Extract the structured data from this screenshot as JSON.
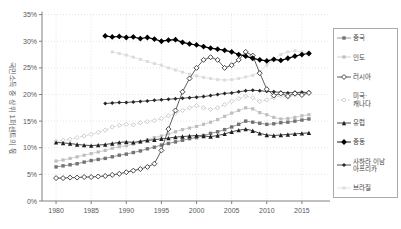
{
  "chart_data": {
    "type": "line",
    "title": "",
    "ylabel": "국민소득 중 상위 1퍼센트의 몫",
    "xlabel": "",
    "grid": true,
    "legend_position": "right",
    "xlim": [
      1978,
      2019
    ],
    "ylim": [
      0,
      35
    ],
    "x_ticks": [
      1980,
      1985,
      1990,
      1995,
      2000,
      2005,
      2010,
      2015
    ],
    "y_ticks": [
      0,
      5,
      10,
      15,
      20,
      25,
      30,
      35
    ],
    "y_tick_suffix": "%",
    "series": [
      {
        "name": "중국",
        "legend_label": "중국",
        "marker": "square",
        "color": "#737373",
        "line_color": "#8c8c8c",
        "dash": "",
        "marker_size": 3.4,
        "start_year": 1980,
        "values": [
          6.4,
          6.6,
          6.8,
          7.0,
          7.3,
          7.6,
          7.8,
          8.0,
          8.3,
          8.6,
          8.8,
          9.1,
          9.4,
          9.8,
          10.1,
          10.5,
          10.8,
          11.1,
          11.4,
          11.7,
          11.9,
          12.3,
          12.7,
          13.0,
          13.4,
          13.9,
          14.4,
          15.0,
          14.8,
          14.6,
          14.4,
          14.5,
          14.7,
          14.8,
          15.0,
          15.2,
          15.4
        ]
      },
      {
        "name": "인도",
        "legend_label": "인도",
        "marker": "square",
        "color": "#bfbfbf",
        "line_color": "#c9c9c9",
        "dash": "",
        "marker_size": 3.2,
        "start_year": 1980,
        "values": [
          7.5,
          7.7,
          8.0,
          8.3,
          8.6,
          8.9,
          9.2,
          9.5,
          9.9,
          10.2,
          10.4,
          10.7,
          11.1,
          11.5,
          11.9,
          12.2,
          12.6,
          13.0,
          13.4,
          13.7,
          14.0,
          14.4,
          14.8,
          15.3,
          15.9,
          16.5,
          17.0,
          17.5,
          17.3,
          16.6,
          16.2,
          15.7,
          15.4,
          15.5,
          15.7,
          16.0,
          16.2
        ]
      },
      {
        "name": "러시아",
        "legend_label": "러시아",
        "marker": "diamond-open",
        "color": "#333333",
        "line_color": "#4d4d4d",
        "dash": "",
        "marker_size": 5.0,
        "start_year": 1980,
        "values": [
          4.3,
          4.3,
          4.4,
          4.4,
          4.5,
          4.5,
          4.6,
          4.7,
          4.9,
          5.1,
          5.4,
          5.7,
          6.0,
          6.4,
          7.0,
          9.5,
          13.5,
          17.0,
          20.5,
          23.0,
          25.0,
          26.5,
          27.0,
          26.5,
          25.0,
          25.5,
          26.5,
          28.0,
          27.3,
          24.0,
          21.0,
          19.8,
          20.2,
          19.7,
          20.2,
          19.9,
          20.3
        ]
      },
      {
        "name": "미국·캐나다",
        "legend_label": "미국·\n캐나다",
        "marker": "diamond-open-light",
        "color": "#c6c6c6",
        "line_color": "#cccccc",
        "dash": "2,1.5",
        "marker_size": 4.2,
        "start_year": 1980,
        "values": [
          11.2,
          11.4,
          11.6,
          11.9,
          12.2,
          12.5,
          12.9,
          13.3,
          13.9,
          14.2,
          14.4,
          14.3,
          14.7,
          14.9,
          15.1,
          15.5,
          16.0,
          16.5,
          17.0,
          17.5,
          17.9,
          17.5,
          17.2,
          17.5,
          18.1,
          18.7,
          19.2,
          19.7,
          19.4,
          18.7,
          19.0,
          19.4,
          19.8,
          19.5,
          19.9,
          20.2,
          20.4
        ]
      },
      {
        "name": "유럽",
        "legend_label": "유럽",
        "marker": "triangle",
        "color": "#1f1f1f",
        "line_color": "#333333",
        "dash": "",
        "marker_size": 4.4,
        "start_year": 1980,
        "values": [
          11.0,
          10.9,
          10.8,
          10.6,
          10.5,
          10.4,
          10.5,
          10.6,
          10.8,
          11.0,
          11.1,
          11.0,
          11.2,
          11.4,
          11.5,
          11.7,
          11.8,
          12.0,
          12.1,
          12.2,
          12.3,
          12.2,
          12.1,
          12.3,
          12.6,
          13.0,
          13.3,
          13.5,
          13.2,
          12.7,
          12.4,
          12.3,
          12.4,
          12.5,
          12.6,
          12.7,
          12.8
        ]
      },
      {
        "name": "중동",
        "legend_label": "중동",
        "marker": "diamond",
        "color": "#000000",
        "line_color": "#000000",
        "dash": "",
        "marker_size": 5.8,
        "start_year": 1987,
        "values": [
          31.0,
          30.8,
          30.9,
          30.7,
          30.8,
          30.5,
          30.7,
          30.4,
          30.0,
          30.2,
          30.3,
          29.8,
          29.5,
          29.3,
          29.0,
          28.7,
          28.5,
          28.3,
          28.0,
          27.5,
          27.2,
          26.8,
          26.5,
          26.3,
          26.6,
          26.4,
          26.8,
          27.2,
          27.5,
          27.7
        ]
      },
      {
        "name": "사하라 이남 아프리카",
        "legend_label": "사하라 이남\n아프리카",
        "marker": "diamond",
        "color": "#262626",
        "line_color": "#404040",
        "dash": "",
        "marker_size": 4.0,
        "start_year": 1987,
        "values": [
          18.3,
          18.4,
          18.5,
          18.5,
          18.6,
          18.7,
          18.8,
          18.9,
          19.0,
          19.1,
          19.2,
          19.3,
          19.4,
          19.5,
          19.6,
          19.8,
          20.0,
          20.2,
          20.3,
          20.5,
          20.7,
          20.8,
          20.7,
          20.6,
          20.5,
          20.4,
          20.3,
          20.4,
          20.4,
          20.4
        ]
      },
      {
        "name": "브라질",
        "legend_label": "브라질",
        "marker": "square",
        "color": "#dcdcdc",
        "line_color": "#e0e0e0",
        "dash": "",
        "marker_size": 3.0,
        "start_year": 1988,
        "values": [
          28.0,
          27.7,
          27.4,
          27.0,
          26.6,
          26.2,
          25.8,
          25.5,
          25.0,
          24.6,
          24.2,
          23.8,
          23.5,
          23.2,
          23.0,
          22.8,
          22.7,
          22.8,
          23.0,
          23.3,
          23.6,
          24.3,
          25.5,
          26.6,
          27.5,
          28.0,
          28.2,
          28.0,
          27.8
        ]
      }
    ],
    "colors": {
      "axis": "#808080",
      "grid": "#d9d9d9",
      "tick_text": "#595959",
      "legend_border": "#ababab"
    }
  }
}
